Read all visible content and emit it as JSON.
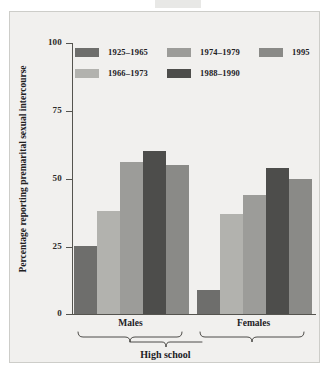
{
  "chart_data": {
    "type": "bar",
    "title": "",
    "xlabel": "High school",
    "ylabel": "Percentage reporting premarital sexual intercourse",
    "ylim": [
      0,
      100
    ],
    "yticks": [
      0,
      25,
      50,
      75,
      100
    ],
    "ytick_labels": [
      "0",
      "25",
      "50",
      "75",
      "100"
    ],
    "grid": false,
    "legend_position": "top",
    "categories": [
      "Males",
      "Females"
    ],
    "series": [
      {
        "name": "1925–1965",
        "color": "#6e6e6c",
        "values": [
          25,
          9
        ]
      },
      {
        "name": "1966–1973",
        "color": "#b2b2ae",
        "values": [
          38,
          37
        ]
      },
      {
        "name": "1974–1979",
        "color": "#9c9c99",
        "values": [
          56,
          44
        ]
      },
      {
        "name": "1988–1990",
        "color": "#4d4d4b",
        "values": [
          60,
          54
        ]
      },
      {
        "name": "1995",
        "color": "#8a8a87",
        "values": [
          55,
          50
        ]
      }
    ]
  },
  "axis": {
    "y_label": "Percentage reporting premarital sexual intercourse",
    "tick_100": "100",
    "tick_75": "75",
    "tick_50": "50",
    "tick_25": "25",
    "tick_0": "0"
  },
  "groups": {
    "males": "Males",
    "females": "Females",
    "bottom": "High school"
  },
  "legend": {
    "items": [
      {
        "label": "1925–1965",
        "color": "#6e6e6c"
      },
      {
        "label": "1974–1979",
        "color": "#9c9c99"
      },
      {
        "label": "1995",
        "color": "#8a8a87"
      },
      {
        "label": "1966–1973",
        "color": "#b2b2ae"
      },
      {
        "label": "1988–1990",
        "color": "#4d4d4b"
      }
    ]
  },
  "colors": {
    "plate_background": "#f1f0ee",
    "plate_border": "#cdcdc9",
    "axis": "#55544f",
    "text": "#22211f"
  }
}
